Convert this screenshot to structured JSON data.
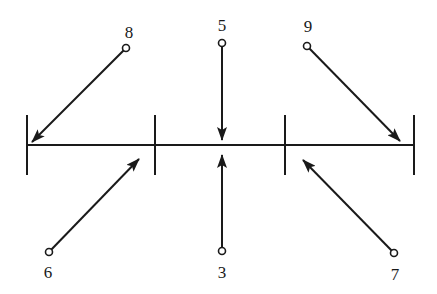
{
  "diagram": {
    "baseline": {
      "x1": 27,
      "x2": 414,
      "y": 145
    },
    "ticks": [
      {
        "x": 27,
        "y1": 115,
        "y2": 175
      },
      {
        "x": 155,
        "y1": 115,
        "y2": 175
      },
      {
        "x": 285,
        "y1": 115,
        "y2": 175
      },
      {
        "x": 414,
        "y1": 115,
        "y2": 175
      }
    ],
    "nodes": [
      {
        "label": "8",
        "cx": 126,
        "cy": 48,
        "lx": 129,
        "ly": 38,
        "tx": 32,
        "ty": 142
      },
      {
        "label": "5",
        "cx": 222,
        "cy": 43,
        "lx": 222,
        "ly": 31,
        "tx": 222,
        "ty": 140
      },
      {
        "label": "9",
        "cx": 307,
        "cy": 46,
        "lx": 308,
        "ly": 32,
        "tx": 400,
        "ty": 141
      },
      {
        "label": "6",
        "cx": 49,
        "cy": 252,
        "lx": 48,
        "ly": 278,
        "tx": 139,
        "ty": 159
      },
      {
        "label": "3",
        "cx": 222,
        "cy": 251,
        "lx": 222,
        "ly": 278,
        "tx": 222,
        "ty": 155
      },
      {
        "label": "7",
        "cx": 394,
        "cy": 253,
        "lx": 395,
        "ly": 280,
        "tx": 303,
        "ty": 160
      }
    ]
  }
}
